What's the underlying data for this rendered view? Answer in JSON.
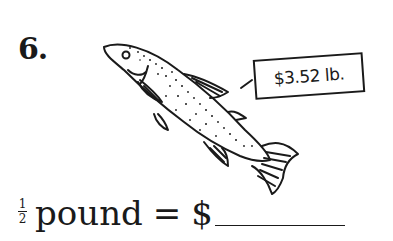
{
  "problem": {
    "number": "6.",
    "price_tag": "$3.52 lb.",
    "question": {
      "fraction_numerator": "1",
      "fraction_denominator": "2",
      "unit": "pound",
      "equals": "=",
      "currency": "$",
      "answer_value": ""
    },
    "illustration": "fish-illustration"
  }
}
